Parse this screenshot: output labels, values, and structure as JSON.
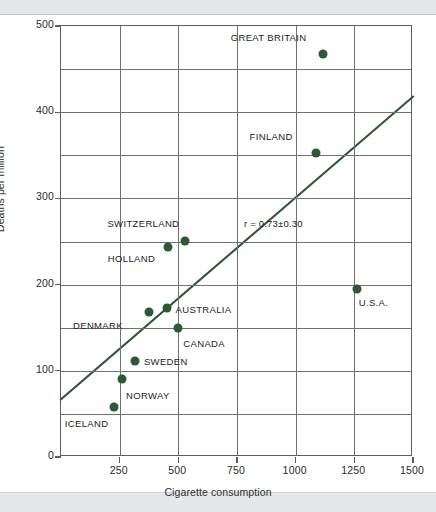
{
  "chart_data": {
    "type": "scatter",
    "title": "",
    "xlabel": "Cigarette consumption",
    "ylabel": "Deaths per million",
    "xlim": [
      0,
      1500
    ],
    "ylim": [
      0,
      500
    ],
    "x_ticks": [
      250,
      500,
      750,
      1000,
      1250,
      1500
    ],
    "y_ticks": [
      0,
      100,
      200,
      300,
      400,
      500
    ],
    "x_gridlines": [
      250,
      500,
      750,
      1000,
      1250
    ],
    "y_gridlines": [
      50,
      100,
      150,
      200,
      250,
      300,
      350,
      400,
      450
    ],
    "grid": true,
    "legend": "none",
    "point_color": "#2d5a32",
    "points": [
      {
        "label": "GREAT BRITAIN",
        "x": 1115,
        "y": 468,
        "label_dx": -92,
        "label_dy": -16
      },
      {
        "label": "FINLAND",
        "x": 1085,
        "y": 353,
        "label_dx": -66,
        "label_dy": -16
      },
      {
        "label": "SWITZERLAND",
        "x": 530,
        "y": 251,
        "label_dx": -78,
        "label_dy": -17
      },
      {
        "label": "HOLLAND",
        "x": 455,
        "y": 244,
        "label_dx": -60,
        "label_dy": 12
      },
      {
        "label": "U.S.A.",
        "x": 1260,
        "y": 195,
        "label_dx": 2,
        "label_dy": 14
      },
      {
        "label": "AUSTRALIA",
        "x": 450,
        "y": 173,
        "label_dx": 9,
        "label_dy": 2
      },
      {
        "label": "DENMARK",
        "x": 375,
        "y": 168,
        "label_dx": -76,
        "label_dy": 14
      },
      {
        "label": "CANADA",
        "x": 500,
        "y": 150,
        "label_dx": 5,
        "label_dy": 16
      },
      {
        "label": "SWEDEN",
        "x": 315,
        "y": 112,
        "label_dx": 9,
        "label_dy": 1
      },
      {
        "label": "NORWAY",
        "x": 260,
        "y": 91,
        "label_dx": 4,
        "label_dy": 17
      },
      {
        "label": "ICELAND",
        "x": 225,
        "y": 58,
        "label_dx": -49,
        "label_dy": 17
      }
    ],
    "trendline": {
      "x0": 0,
      "y0": 67,
      "x1": 1500,
      "y1": 418,
      "color": "#2d5a32"
    },
    "annotations": [
      {
        "text": "r = 0.73±0.30",
        "x": 780,
        "y": 270
      }
    ]
  }
}
